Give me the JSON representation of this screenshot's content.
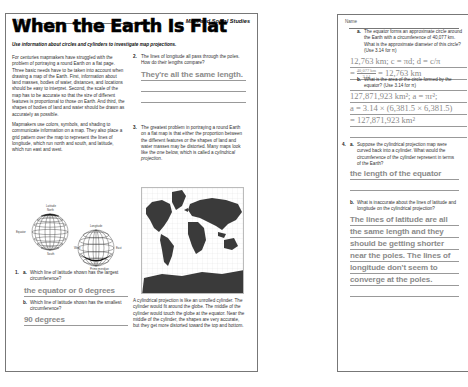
{
  "left_page": {
    "name_label": "Name",
    "subject": "Math and Social Studies",
    "title": "When the Earth Is Flat",
    "subtitle": "Use information about circles and cylinders to investigate map projections.",
    "intro_paragraphs": [
      "For centuries mapmakers have struggled with the problem of portraying a round Earth on a flat page. Three basic needs have to be taken into account when drawing a map of the Earth. First, information about land masses, bodies of water, distances, and locations should be easy to interpret. Second, the scale of the map has to be accurate so that the size of different features is proportional to those on Earth. And third, the shapes of bodies of land and water should be drawn as accurately as possible.",
      "Mapmakers use colors, symbols, and shading to communicate information on a map. They also place a grid pattern over the map to represent the lines of longitude, which run north and south, and latitude, which run east and west."
    ],
    "diagram": {
      "latitude_label": "Latitude",
      "north_label": "North",
      "equator_label": "Equator",
      "south_label": "South",
      "longitude_label": "Longitude",
      "west_label": "West",
      "east_label": "East",
      "prime_meridian_label": "Prime meridian"
    },
    "q1": {
      "number": "1.",
      "a_letter": "a.",
      "a_question": "Which line of latitude shown has the largest circumference?",
      "a_answer": "the equator or 0 degrees",
      "b_letter": "b.",
      "b_question": "Which line of latitude shown has the smallest circumference?",
      "b_answer": "90 degrees"
    },
    "q2": {
      "number": "2.",
      "question": "The lines of longitude all pass through the poles. How do their lengths compare?",
      "answer": "They're all the same length."
    },
    "q3": {
      "number": "3.",
      "question_pre": "The greatest problem in portraying a round Earth on a flat map is that either the proportion between the different features or the shapes of land and water masses may be distorted. Many maps look like the one below, which is called a ",
      "question_em": "cylindrical projection",
      "question_post": ".",
      "description": "A cylindrical projection is like an unrolled cylinder. The cylinder would fit around the globe. The middle of the cylinder would touch the globe at the equator. Near the middle of the cylinder, the shapes are very accurate, but they get more distorted toward the top and bottom."
    }
  },
  "right_page": {
    "name_label": "Name",
    "qa": {
      "letter": "a.",
      "question": "The equator forms an approximate circle around the Earth with a circumference of 40,077 km. What is the approximate diameter of this circle? (Use 3.14 for π)",
      "answer_line1": "12,763 km; c = πd; d = c/π",
      "answer_line2_num": "40,077 km",
      "answer_line2_den": "3.14",
      "answer_line2_result": "= 12,763 km"
    },
    "qb": {
      "letter": "b.",
      "question": "What is the area of the circle formed by the equator? (Use 3.14 for π)",
      "answer_line1": "127,871,923 km²; a = πr²;",
      "answer_line2": "a = 3.14 × (6,381.5 × 6,381.5)",
      "answer_line3": "= 127,871,923 km²"
    },
    "q4a": {
      "number": "4.",
      "letter": "a.",
      "question": "Suppose the cylindrical projection map were curved back into a cylinder. What would the circumference of the cylinder represent in terms of the Earth?",
      "answer": "the length of the equator"
    },
    "q4b": {
      "letter": "b.",
      "question": "What is inaccurate about the lines of latitude and longitude on the cylindrical projection?",
      "answer_lines": [
        "The lines of latitude are all",
        "the same length and they",
        "should be getting shorter",
        "near the poles. The lines of",
        "longitude don't seem to",
        "converge at the poles."
      ]
    }
  },
  "colors": {
    "answer_gray": "#8a8a8a",
    "border": "#777777",
    "map_land": "#3a3a3a"
  }
}
